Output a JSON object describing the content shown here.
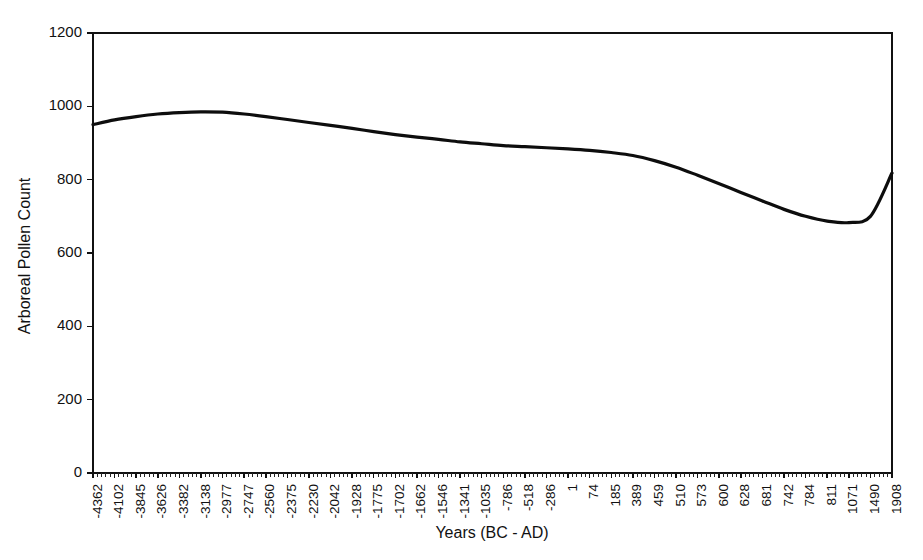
{
  "chart_data": {
    "type": "line",
    "title": "",
    "xlabel": "Years (BC - AD)",
    "ylabel": "Arboreal Pollen Count",
    "grid": false,
    "legend": "none",
    "ylim": [
      0,
      1200
    ],
    "ytick_labels": [
      "1200",
      "1000",
      "800",
      "600",
      "400",
      "200",
      "0"
    ],
    "ytick_values": [
      1200,
      1000,
      800,
      600,
      400,
      200,
      0
    ],
    "ytick_step": 200,
    "x_is_categorical": true,
    "minor_ticks_per_interval": 5,
    "categories": [
      "-4362",
      "-4102",
      "-3845",
      "-3626",
      "-3382",
      "-3138",
      "-2977",
      "-2747",
      "-2560",
      "-2375",
      "-2230",
      "-2042",
      "-1928",
      "-1775",
      "-1702",
      "-1662",
      "-1546",
      "-1341",
      "-1035",
      "-786",
      "-518",
      "-286",
      "1",
      "74",
      "185",
      "389",
      "459",
      "510",
      "573",
      "600",
      "628",
      "681",
      "742",
      "784",
      "811",
      "1071",
      "1490",
      "1908"
    ],
    "series": [
      {
        "name": "Arboreal Pollen Count",
        "color": "#0d0d0d",
        "values": [
          950,
          963,
          972,
          979,
          983,
          985,
          984,
          979,
          972,
          964,
          956,
          948,
          940,
          931,
          923,
          916,
          910,
          903,
          898,
          893,
          890,
          887,
          884,
          880,
          874,
          866,
          852,
          834,
          812,
          789,
          765,
          742,
          719,
          700,
          687,
          683,
          700,
          818
        ]
      }
    ],
    "annotations": []
  },
  "axes": {
    "x_axis_title": "Years (BC - AD)",
    "y_axis_title": "Arboreal Pollen Count"
  }
}
